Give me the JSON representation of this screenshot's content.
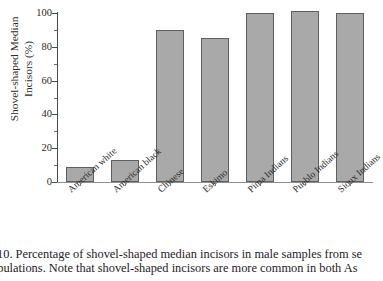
{
  "figure": {
    "caption_line_1": "10.  Percentage of shovel-shaped median incisors in male samples from se",
    "caption_line_2": "opulations. Note that shovel-shaped incisors are more common in both As"
  },
  "axes": {
    "y_title_line_1": "Shovel-shaped Median",
    "y_title_line_2": "Incisors (%)",
    "y_ticks": [
      "0",
      "20",
      "40",
      "60",
      "80",
      "100"
    ]
  },
  "colors": {
    "bar_fill": "#a9a9a9",
    "bar_border": "#5f5f5f",
    "axis": "#4a4a4a",
    "text": "#2b2b2b"
  },
  "chart_data": {
    "type": "bar",
    "title": "",
    "xlabel": "",
    "ylabel": "Shovel-shaped Median Incisors (%)",
    "ylim": [
      0,
      100
    ],
    "yticks": [
      0,
      20,
      40,
      60,
      80,
      100
    ],
    "grid": false,
    "legend": false,
    "categories": [
      "American white",
      "American black",
      "Chinese",
      "Eskimo",
      "Pima Indians",
      "Pueblo Indians",
      "Sioux Indians"
    ],
    "values": [
      9,
      13,
      90,
      85,
      100,
      101,
      100
    ]
  }
}
